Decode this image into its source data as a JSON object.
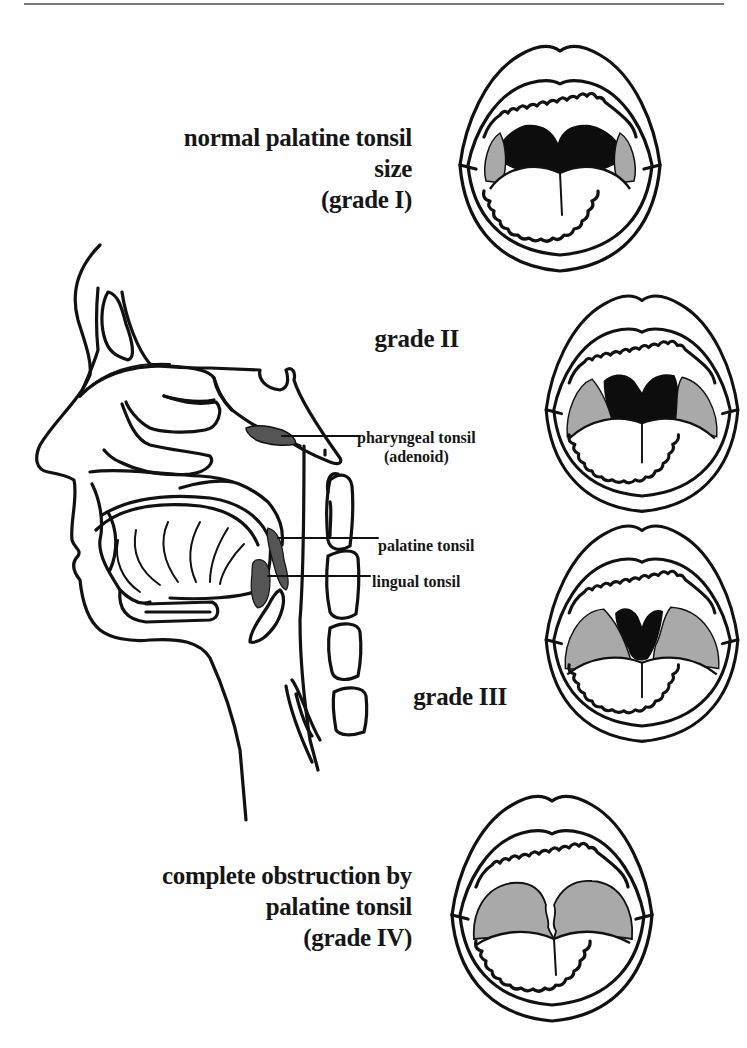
{
  "figure": {
    "colors": {
      "outline": "#111111",
      "tonsil_fill": "#a9a9a9",
      "lymphoid_dark": "#555555",
      "pharynx_dark": "#0d0d0d",
      "rule": "#7a7a7a",
      "background": "#ffffff"
    },
    "grades": [
      {
        "id": "grade-1",
        "lines": [
          "normal palatine tonsil",
          "size",
          "(grade I)"
        ]
      },
      {
        "id": "grade-2",
        "lines": [
          "grade II"
        ]
      },
      {
        "id": "grade-3",
        "lines": [
          "grade III"
        ]
      },
      {
        "id": "grade-4",
        "lines": [
          "complete obstruction by",
          "palatine tonsil",
          "(grade IV)"
        ]
      }
    ],
    "sagittal_labels": {
      "pharyngeal": [
        "pharyngeal tonsil",
        "(adenoid)"
      ],
      "palatine": "palatine tonsil",
      "lingual": "lingual tonsil"
    }
  }
}
